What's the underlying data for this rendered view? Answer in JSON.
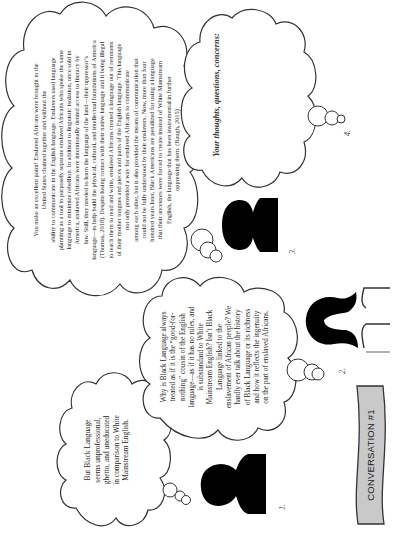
{
  "document": {
    "title": "CONVERSATION #1",
    "orientation": "rotated 90 degrees counter-clockwise",
    "accent_colors": {
      "banner_fill": "#c9c9c9",
      "outline": "#333333",
      "silhouette": "#000000"
    }
  },
  "banner": {
    "label": "CONVERSATION #1"
  },
  "speakers": [
    {
      "label": "1.",
      "icon": "person-silhouette-short-hair"
    },
    {
      "label": "2.",
      "icon": "person-silhouette-long-hair"
    },
    {
      "label": "3.",
      "icon": "person-silhouette-afro"
    },
    {
      "label": "4.",
      "icon": "empty"
    }
  ],
  "bubbles": [
    {
      "speaker": "1.",
      "text": "But Black Language\nseems unprofessional,\nghetto, and uneducated\nin comparison to White\nMainstream English."
    },
    {
      "speaker": "2.",
      "text": "Why is Black Language always\ntreated as if it is the “good-for-\nnothing” cousin of the English\nlanguage—as if it has no rules, and\nis substandard to White\nMainstream English? Isn’t Black\nLanguage linked to the\nenslavement of African people? We\nhardly ever talk about the history\nof Black Language or its richness\nand how it reflects the ingenuity\non the part of enslaved Africans."
    },
    {
      "speaker": "3.",
      "text": "You make an excellent point! Enslaved Africans were brought to the\nUnited States chained together and without the\nability to communicate in the English language. Enslavers used language\nplanning as a tool to purposely separate enslaved Africans who spoke the same\nlanguage to minimize rebellion. In addition to linguistic isolation, once sold in\nAmerica, enslaved Africans were intentionally denied access to literacy by\nlaw. Still, they needed to learn the language of the land—their oppressor’s\nlanguage—to help build the physical, cultural, and intellectual foundations of America\n(Thomas, 2018). Despite losing contact with their native language and it being illegal\nto teach them to read and write, enslaved Africans created a language out of remnants\nof their mother tongues and pieces and parts of the English language. This language\nnot only provided a way for enslaved Africans to communicate\namong each other, but it also provided the means of communication that\ncould not be fully understood by their enslavers. Now, more than four\nhundred years later, Black Americans are penalized for using a language\nthat their ancestors were forced to create instead of White Mainstream\nEnglish, the language that has been instrumental in further\noppressing them. (Baugh, 2015)"
    },
    {
      "speaker": "4.",
      "prompt": "Your thoughts, questions, concerns:",
      "text": ""
    }
  ]
}
